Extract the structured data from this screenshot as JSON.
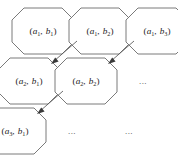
{
  "figure": {
    "type": "diagram",
    "width": 178,
    "height": 159,
    "background_color": "#ffffff",
    "cell_outline_color": "#6b6b6b",
    "arrow_color": "#3a3a3a",
    "text_color": "#1a1a1a"
  },
  "grid": {
    "rows": 3,
    "columns": 3,
    "row_offset_x": -14,
    "row_offset_y": 50,
    "column_step_x": 57,
    "cell_width": 62,
    "cell_height": 46,
    "corner_cut": 12
  },
  "cells": [
    {
      "id": "cell-r1c1",
      "row": 1,
      "column": 1,
      "kind": "pair",
      "base_a": "a",
      "sub_a": "1",
      "base_b": "b",
      "sub_b": "1",
      "label": "(a1, b1)",
      "x": 12,
      "y": 8
    },
    {
      "id": "cell-r1c2",
      "row": 1,
      "column": 2,
      "kind": "pair",
      "base_a": "a",
      "sub_a": "1",
      "base_b": "b",
      "sub_b": "2",
      "label": "(a1, b2)",
      "x": 69,
      "y": 8
    },
    {
      "id": "cell-r1c3",
      "row": 1,
      "column": 3,
      "kind": "pair",
      "base_a": "a",
      "sub_a": "1",
      "base_b": "b",
      "sub_b": "3",
      "label": "(a1, b3)",
      "x": 126,
      "y": 8
    },
    {
      "id": "cell-r2c1",
      "row": 2,
      "column": 1,
      "kind": "pair",
      "base_a": "a",
      "sub_a": "2",
      "base_b": "b",
      "sub_b": "1",
      "label": "(a2, b1)",
      "x": -2,
      "y": 58
    },
    {
      "id": "cell-r2c2",
      "row": 2,
      "column": 2,
      "kind": "pair",
      "base_a": "a",
      "sub_a": "2",
      "base_b": "b",
      "sub_b": "2",
      "label": "(a2, b2)",
      "x": 55,
      "y": 58
    },
    {
      "id": "cell-r2c3",
      "row": 2,
      "column": 3,
      "kind": "ellipsis",
      "label": "...",
      "x": 112,
      "y": 58
    },
    {
      "id": "cell-r3c1",
      "row": 3,
      "column": 1,
      "kind": "pair",
      "base_a": "a",
      "sub_a": "3",
      "base_b": "b",
      "sub_b": "1",
      "label": "(a3, b1)",
      "x": -16,
      "y": 108
    },
    {
      "id": "cell-r3c2",
      "row": 3,
      "column": 2,
      "kind": "ellipsis",
      "label": "...",
      "x": 41,
      "y": 108
    },
    {
      "id": "cell-r3c3",
      "row": 3,
      "column": 3,
      "kind": "ellipsis",
      "label": "...",
      "x": 98,
      "y": 108
    }
  ],
  "arrows": [
    {
      "id": "arrow-1",
      "from_cell": "cell-r1c2",
      "to_cell": "cell-r2c1",
      "direction": "down-left",
      "x1": 77,
      "y1": 41,
      "x2": 51,
      "y2": 64
    },
    {
      "id": "arrow-2",
      "from_cell": "cell-r1c3",
      "to_cell": "cell-r2c2",
      "direction": "down-left",
      "x1": 134,
      "y1": 41,
      "x2": 108,
      "y2": 64
    },
    {
      "id": "arrow-3",
      "from_cell": "cell-r2c2",
      "to_cell": "cell-r3c1",
      "direction": "down-left",
      "x1": 63,
      "y1": 91,
      "x2": 37,
      "y2": 114
    }
  ],
  "ellipsis_text": "..."
}
